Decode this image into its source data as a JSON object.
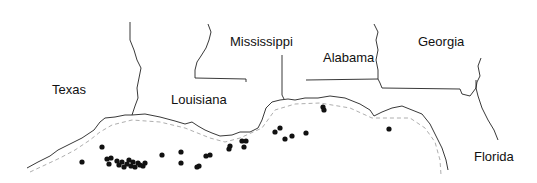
{
  "map": {
    "states": [
      {
        "name": "Texas",
        "x": 52,
        "y": 83
      },
      {
        "name": "Louisiana",
        "x": 171,
        "y": 93
      },
      {
        "name": "Mississippi",
        "x": 230,
        "y": 35
      },
      {
        "name": "Alabama",
        "x": 323,
        "y": 51
      },
      {
        "name": "Georgia",
        "x": 418,
        "y": 35
      },
      {
        "name": "Florida",
        "x": 474,
        "y": 150
      }
    ],
    "points": [
      [
        82,
        162
      ],
      [
        102,
        147
      ],
      [
        107,
        159
      ],
      [
        111,
        158
      ],
      [
        109,
        164
      ],
      [
        117,
        161
      ],
      [
        119,
        165
      ],
      [
        122,
        162
      ],
      [
        124,
        167
      ],
      [
        127,
        164
      ],
      [
        129,
        160
      ],
      [
        131,
        166
      ],
      [
        133,
        162
      ],
      [
        135,
        167
      ],
      [
        138,
        163
      ],
      [
        140,
        165
      ],
      [
        143,
        166
      ],
      [
        145,
        163
      ],
      [
        162,
        155
      ],
      [
        181,
        152
      ],
      [
        181,
        163
      ],
      [
        197,
        167
      ],
      [
        199,
        166
      ],
      [
        206,
        156
      ],
      [
        210,
        155
      ],
      [
        229,
        149
      ],
      [
        230,
        146
      ],
      [
        242,
        141
      ],
      [
        246,
        141
      ],
      [
        244,
        147
      ],
      [
        275,
        132
      ],
      [
        280,
        128
      ],
      [
        285,
        139
      ],
      [
        292,
        136
      ],
      [
        306,
        133
      ],
      [
        323,
        107
      ],
      [
        324,
        110
      ],
      [
        389,
        129
      ]
    ],
    "colors": {
      "land_line": "#222222",
      "shelf_line": "#999999",
      "point": "#111111"
    }
  }
}
